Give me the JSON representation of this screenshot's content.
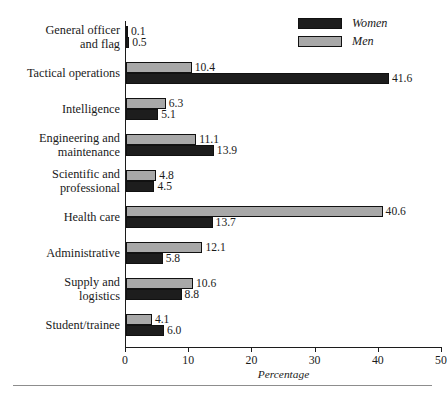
{
  "chart_data": {
    "type": "bar",
    "orientation": "horizontal",
    "title": "",
    "xlabel": "Percentage",
    "ylabel": "",
    "xlim": [
      0,
      50
    ],
    "xticks": [
      0,
      10,
      20,
      30,
      40,
      50
    ],
    "grid": false,
    "legend_position": "top-right",
    "categories": [
      "General officer\nand flag",
      "Tactical operations",
      "Intelligence",
      "Engineering and\nmaintenance",
      "Scientific and\nprofessional",
      "Health care",
      "Administrative",
      "Supply and\nlogistics",
      "Student/trainee"
    ],
    "series": [
      {
        "name": "Women",
        "color": "#1d1d1d",
        "values": [
          0.5,
          41.6,
          5.1,
          13.9,
          4.5,
          13.7,
          5.8,
          8.8,
          6.0
        ],
        "value_labels": [
          "0.5",
          "41.6",
          "5.1",
          "13.9",
          "4.5",
          "13.7",
          "5.8",
          "8.8",
          "6.0"
        ]
      },
      {
        "name": "Men",
        "color": "#a8a8a8",
        "values": [
          0.1,
          10.4,
          6.3,
          11.1,
          4.8,
          40.6,
          12.1,
          10.6,
          4.1
        ],
        "value_labels": [
          "0.1",
          "10.4",
          "6.3",
          "11.1",
          "4.8",
          "40.6",
          "12.1",
          "10.6",
          "4.1"
        ]
      }
    ],
    "series_draw_order": [
      "Men",
      "Women"
    ],
    "xtick_labels": [
      "0",
      "10",
      "20",
      "30",
      "40",
      "50"
    ]
  },
  "legend": {
    "entries": [
      {
        "label": "Women",
        "swatch": "women"
      },
      {
        "label": "Men",
        "swatch": "men"
      }
    ]
  },
  "axis": {
    "x_title": "Percentage"
  }
}
